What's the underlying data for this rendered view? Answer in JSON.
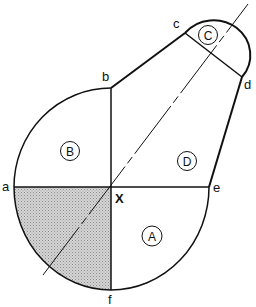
{
  "diagram": {
    "points": {
      "a": "a",
      "b": "b",
      "c": "c",
      "d": "d",
      "e": "e",
      "f": "f",
      "X": "X"
    },
    "regions": {
      "A": "A",
      "B": "B",
      "C": "C",
      "D": "D"
    },
    "shaded_region": "quadrant a-X-f",
    "colors": {
      "line": "#111111",
      "shade": "#bdbdbd",
      "background": "#ffffff"
    }
  }
}
